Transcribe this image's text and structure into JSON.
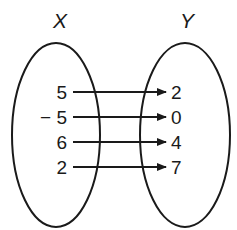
{
  "diagram": {
    "type": "mapping",
    "domain_label": "X",
    "range_label": "Y",
    "domain_values": [
      "5",
      "− 5",
      "6",
      "2"
    ],
    "range_values": [
      "2",
      "0",
      "4",
      "7"
    ],
    "mappings": [
      {
        "from": "5",
        "to": "2"
      },
      {
        "from": "-5",
        "to": "0"
      },
      {
        "from": "6",
        "to": "4"
      },
      {
        "from": "2",
        "to": "7"
      }
    ],
    "colors": {
      "stroke": "#1a1a1a",
      "background": "#ffffff"
    }
  }
}
